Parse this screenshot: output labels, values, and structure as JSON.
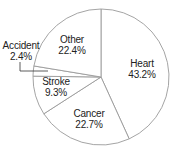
{
  "chart_data": {
    "type": "pie",
    "title": "",
    "start_angle_deg": 0,
    "direction": "clockwise",
    "slices": [
      {
        "label": "Heart",
        "value": 43.2,
        "display": "43.2%",
        "color": "#ffffff"
      },
      {
        "label": "Cancer",
        "value": 22.7,
        "display": "22.7%",
        "color": "#ffffff"
      },
      {
        "label": "Stroke",
        "value": 9.3,
        "display": "9.3%",
        "color": "#ffffff"
      },
      {
        "label": "Accident",
        "value": 2.4,
        "display": "2.4%",
        "color": "#ffffff"
      },
      {
        "label": "Other",
        "value": 22.4,
        "display": "22.4%",
        "color": "#ffffff"
      }
    ],
    "stroke_color": "#9a9a9a",
    "legend": "none"
  },
  "labels": {
    "heart": {
      "name": "Heart",
      "pct": "43.2%"
    },
    "cancer": {
      "name": "Cancer",
      "pct": "22.7%"
    },
    "stroke": {
      "name": "Stroke",
      "pct": "9.3%"
    },
    "accident": {
      "name": "Accident",
      "pct": "2.4%"
    },
    "other": {
      "name": "Other",
      "pct": "22.4%"
    }
  }
}
